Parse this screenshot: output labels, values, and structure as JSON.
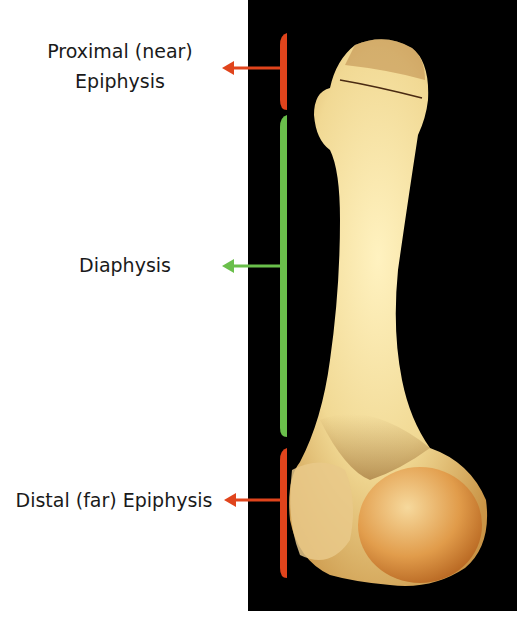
{
  "labels": {
    "proximal_line1": "Proximal (near)",
    "proximal_line2": "Epiphysis",
    "diaphysis": "Diaphysis",
    "distal": "Distal (far) Epiphysis"
  },
  "colors": {
    "epiphysis_bracket": "#e0441c",
    "diaphysis_bracket": "#6abf4b",
    "background_panel": "#000000",
    "bone": "#f3dc9a"
  },
  "regions": [
    {
      "name": "Proximal Epiphysis",
      "bracket_top": 33,
      "bracket_bottom": 110,
      "color": "epiphysis_bracket"
    },
    {
      "name": "Diaphysis",
      "bracket_top": 115,
      "bracket_bottom": 437,
      "color": "diaphysis_bracket"
    },
    {
      "name": "Distal Epiphysis",
      "bracket_top": 448,
      "bracket_bottom": 578,
      "color": "epiphysis_bracket"
    }
  ]
}
